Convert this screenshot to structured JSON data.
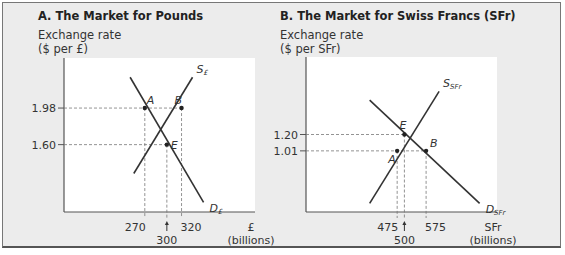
{
  "chart_data": [
    {
      "type": "line",
      "title": "A. The Market for Pounds",
      "ylabel": [
        "Exchange rate",
        "($ per £)"
      ],
      "xlabel": [
        "£",
        "(billions)"
      ],
      "x_ticks": [
        "270",
        "300",
        "320"
      ],
      "y_ticks": [
        "1.98",
        "1.60"
      ],
      "series": [
        {
          "name": "S",
          "subscript": "£",
          "points": [
            [
              255,
              1.3
            ],
            [
              335,
              2.3
            ]
          ]
        },
        {
          "name": "D",
          "subscript": "£",
          "points": [
            [
              250,
              2.3
            ],
            [
              350,
              1.0
            ]
          ]
        }
      ],
      "points": [
        {
          "label": "A",
          "x": 270,
          "y": 1.98
        },
        {
          "label": "B",
          "x": 320,
          "y": 1.98
        },
        {
          "label": "E",
          "x": 300,
          "y": 1.6
        }
      ],
      "arrow_tick": "300",
      "xlim": [
        160,
        420
      ],
      "ylim": [
        0.9,
        2.5
      ]
    },
    {
      "type": "line",
      "title": "B. The Market for Swiss Francs (SFr)",
      "ylabel": [
        "Exchange rate",
        "($ per SFr)"
      ],
      "xlabel": [
        "SFr",
        "(billions)"
      ],
      "x_ticks": [
        "475",
        "500",
        "575"
      ],
      "y_ticks": [
        "1.20",
        "1.01"
      ],
      "series": [
        {
          "name": "S",
          "subscript": "SFr",
          "points": [
            [
              380,
              0.4
            ],
            [
              620,
              1.7
            ]
          ]
        },
        {
          "name": "D",
          "subscript": "SFr",
          "points": [
            [
              380,
              1.6
            ],
            [
              760,
              0.4
            ]
          ]
        }
      ],
      "points": [
        {
          "label": "A",
          "x": 475,
          "y": 1.01
        },
        {
          "label": "B",
          "x": 575,
          "y": 1.01
        },
        {
          "label": "E",
          "x": 500,
          "y": 1.2
        }
      ],
      "arrow_tick": "500",
      "xlim": [
        160,
        820
      ],
      "ylim": [
        0.3,
        2.1
      ]
    }
  ]
}
